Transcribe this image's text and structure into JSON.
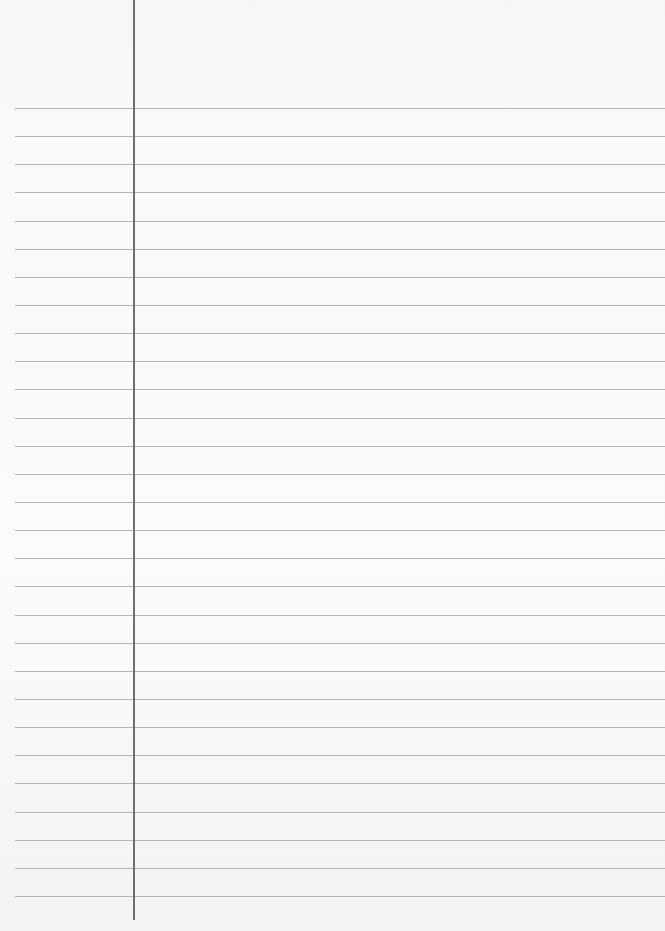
{
  "paper": {
    "type": "lined-notebook-page",
    "background_color": "#f9f9f8",
    "rule_color": "#a9a9a9",
    "margin_line_color": "#6f6f6f",
    "margin_line_x": 133,
    "rule_start_x": 15,
    "first_rule_y": 108,
    "rule_spacing": 28.14,
    "rule_count": 29
  }
}
